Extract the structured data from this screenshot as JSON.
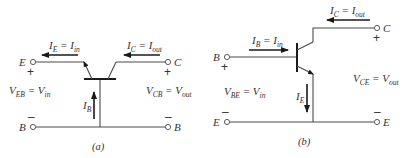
{
  "figure": {
    "stroke_color": "#4a4a4a",
    "arrow_color": "#1a1a1a",
    "text_color": "#333333"
  },
  "circuit_a": {
    "caption": "(a)",
    "configuration": "common-base",
    "terminals": {
      "input_top": "E",
      "input_bottom": "B",
      "output_top": "C",
      "output_bottom": "B"
    },
    "signs": {
      "plus": "+",
      "minus": "–"
    },
    "currents": {
      "input": {
        "lhs": "I",
        "lhs_sub": "E",
        "eq": " = ",
        "rhs": "I",
        "rhs_sub": "in"
      },
      "output": {
        "lhs": "I",
        "lhs_sub": "C",
        "eq": " = ",
        "rhs": "I",
        "rhs_sub": "out"
      },
      "base": {
        "sym": "I",
        "sub": "B"
      }
    },
    "voltages": {
      "input": {
        "lhs": "V",
        "lhs_sub": "EB",
        "eq": " = ",
        "rhs": "V",
        "rhs_sub": "in"
      },
      "output": {
        "lhs": "V",
        "lhs_sub": "CB",
        "eq": " = ",
        "rhs": "V",
        "rhs_sub": "out"
      }
    }
  },
  "circuit_b": {
    "caption": "(b)",
    "configuration": "common-emitter",
    "terminals": {
      "input_top": "B",
      "input_bottom": "E",
      "output_top": "C",
      "output_bottom": "E"
    },
    "signs": {
      "plus": "+",
      "minus": "–"
    },
    "currents": {
      "input": {
        "lhs": "I",
        "lhs_sub": "B",
        "eq": " = ",
        "rhs": "I",
        "rhs_sub": "in"
      },
      "output": {
        "lhs": "I",
        "lhs_sub": "C",
        "eq": " = ",
        "rhs": "I",
        "rhs_sub": "out"
      },
      "emitter": {
        "sym": "I",
        "sub": "E"
      }
    },
    "voltages": {
      "input": {
        "lhs": "V",
        "lhs_sub": "BE",
        "eq": " = ",
        "rhs": "V",
        "rhs_sub": "in"
      },
      "output": {
        "lhs": "V",
        "lhs_sub": "CE",
        "eq": " = ",
        "rhs": "V",
        "rhs_sub": "out"
      }
    }
  }
}
